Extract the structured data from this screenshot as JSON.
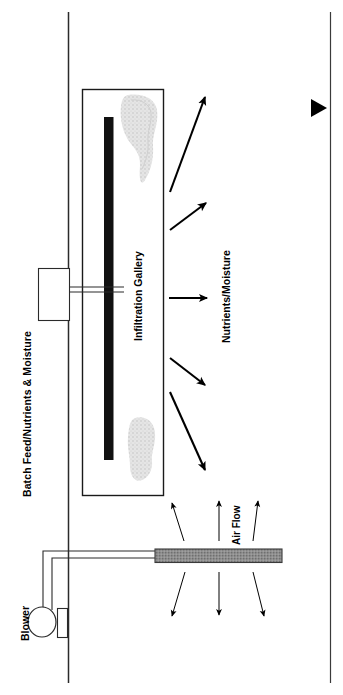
{
  "figure": {
    "title_visible": false,
    "orientation": "rotated-90-ccw",
    "background_color": "#ffffff",
    "line_color": "#000000"
  },
  "labels": {
    "batch_feed": "Batch Feed/Nutrients & Moisture",
    "blower": "Blower",
    "infiltration_gallery": "Infiltration Gallery",
    "nutrients_moisture": "Nutrients/Moisture",
    "air_flow": "Air Flow"
  },
  "components": {
    "ground_line_left": {
      "name": "ground-surface-line",
      "x": 68
    },
    "ground_line_right": {
      "name": "lower-boundary-line",
      "x": 330
    },
    "gallery_box": {
      "name": "infiltration-gallery-enclosure",
      "x": 82,
      "y": 89,
      "width": 81,
      "height": 406,
      "fill": "#ffffff",
      "stroke": "#000000"
    },
    "distribution_pipe": {
      "name": "distribution-pipe",
      "color": "#111111",
      "x": 104,
      "y": 117,
      "width": 9,
      "height": 343
    },
    "feed_tank": {
      "name": "batch-feed-tank",
      "x": 38,
      "y": 268,
      "width": 31,
      "height": 52
    },
    "blower_body": {
      "name": "blower-fan",
      "cx": 42,
      "cy": 622,
      "r": 14
    },
    "blower_housing": {
      "name": "blower-housing",
      "x": 57,
      "y": 608,
      "width": 10,
      "height": 29
    },
    "perforated_pipe": {
      "name": "perforated-air-pipe",
      "x": 155,
      "y": 549,
      "width": 127,
      "height": 13,
      "fill": "#8c8c8c"
    },
    "soil_blob_top": {
      "name": "soil-media-blob-top",
      "fill": "#dcdcdc"
    },
    "soil_blob_bottom": {
      "name": "soil-media-blob-bottom",
      "fill": "#dcdcdc"
    },
    "side_marker_arrow": {
      "name": "boundary-marker-arrowhead",
      "x": 311,
      "y": 100,
      "direction": "right"
    }
  },
  "arrows": {
    "nutrients_moisture_count": 5,
    "air_flow_up_count": 3,
    "air_flow_down_count": 3
  }
}
